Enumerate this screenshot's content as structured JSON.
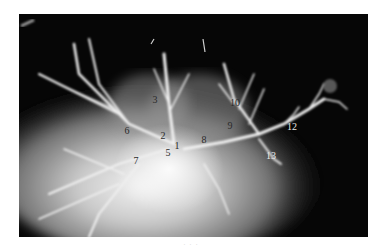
{
  "figure": {
    "type": "angiogram-xray",
    "background_color": "#060606",
    "labels": [
      {
        "text": "1",
        "x": 177,
        "y": 146,
        "tone": "dark"
      },
      {
        "text": "2",
        "x": 163,
        "y": 136,
        "tone": "dark"
      },
      {
        "text": "3",
        "x": 155,
        "y": 100,
        "tone": "dark"
      },
      {
        "text": "5",
        "x": 168,
        "y": 153,
        "tone": "dark"
      },
      {
        "text": "6",
        "x": 127,
        "y": 131,
        "tone": "dark"
      },
      {
        "text": "7",
        "x": 136,
        "y": 161,
        "tone": "dark"
      },
      {
        "text": "8",
        "x": 204,
        "y": 140,
        "tone": "dark"
      },
      {
        "text": "9",
        "x": 230,
        "y": 126,
        "tone": "dark"
      },
      {
        "text": "10",
        "x": 235,
        "y": 103,
        "tone": "dark"
      },
      {
        "text": "12",
        "x": 292,
        "y": 127,
        "tone": "light"
      },
      {
        "text": "13",
        "x": 271,
        "y": 156,
        "tone": "light"
      }
    ]
  },
  "caption": {
    "text": "· · ·"
  }
}
